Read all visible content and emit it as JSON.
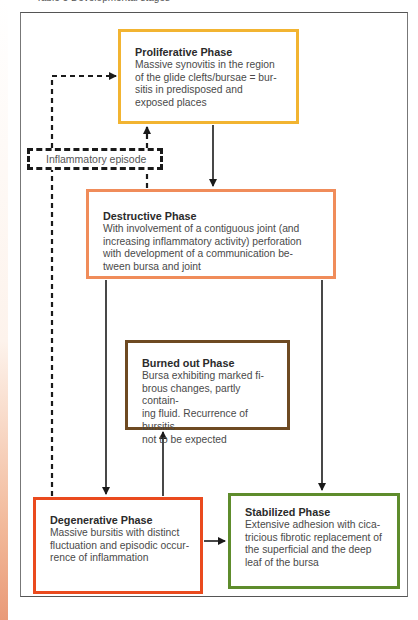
{
  "caption": "Table 5 Developmental stages",
  "diagram": {
    "episode_label": "Inflammatory episode",
    "phases": {
      "proliferative": {
        "title": "Proliferative Phase",
        "body": "Massive synovitis in the region\nof the glide clefts/bursae = bur-\nsitis in predisposed and\nexposed places",
        "border_color": "#f2b431"
      },
      "destructive": {
        "title": "Destructive Phase",
        "body": "With involvement of a contiguous joint (and\nincreasing inflammatory activity) perforation\nwith development of a communication be-\ntween bursa and joint",
        "border_color": "#f08c5a"
      },
      "burned_out": {
        "title": "Burned out Phase",
        "body": "Bursa exhibiting marked fi-\nbrous changes, partly contain-\ning fluid. Recurrence of bursitis\nnot to be expected",
        "border_color": "#6e4a22"
      },
      "degenerative": {
        "title": "Degenerative Phase",
        "body": "Massive bursitis with distinct\nfluctuation and episodic occur-\nrence of inflammation",
        "border_color": "#ea4a1e"
      },
      "stabilized": {
        "title": "Stabilized Phase",
        "body": "Extensive adhesion with cica-\ntricious fibrotic replacement of\nthe superficial and the deep\nleaf of the bursa",
        "border_color": "#5e8c2c"
      }
    },
    "edges": [
      {
        "from": "Proliferative Phase",
        "to": "Destructive Phase",
        "style": "solid"
      },
      {
        "from": "Destructive Phase",
        "to": "Degenerative Phase",
        "style": "solid"
      },
      {
        "from": "Destructive Phase",
        "to": "Stabilized Phase",
        "style": "solid"
      },
      {
        "from": "Degenerative Phase",
        "to": "Burned out Phase",
        "style": "solid"
      },
      {
        "from": "Degenerative Phase",
        "to": "Stabilized Phase",
        "style": "solid"
      },
      {
        "from": "Destructive Phase",
        "to": "Inflammatory episode",
        "style": "dashed"
      },
      {
        "from": "Degenerative Phase",
        "to": "Inflammatory episode",
        "style": "dashed"
      },
      {
        "from": "Inflammatory episode",
        "to": "Proliferative Phase",
        "style": "dashed"
      }
    ]
  }
}
